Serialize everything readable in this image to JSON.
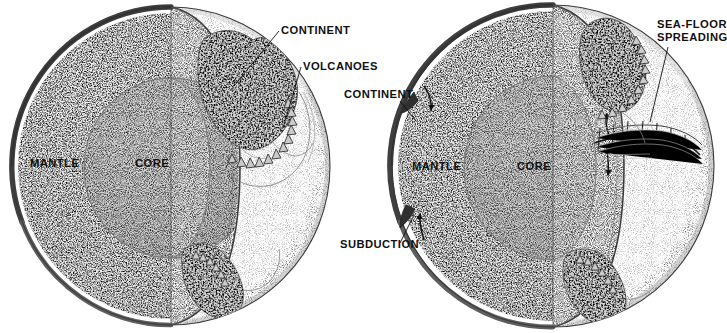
{
  "figure": {
    "background_color": "#ffffff",
    "style": "pen-and-ink stipple scientific illustration",
    "panels": [
      {
        "id": "left-globe",
        "name": "Earth cutaway without plate motion",
        "center": [
          171,
          166
        ],
        "radius": 159,
        "labels": [
          "CONTINENT",
          "VOLCANOES",
          "MANTLE",
          "CORE"
        ]
      },
      {
        "id": "right-globe",
        "name": "Earth cutaway with plate tectonics",
        "center": [
          553,
          166
        ],
        "radius": 161,
        "labels": [
          "SEA-FLOOR SPREADING",
          "CONTINENT",
          "SUBDUCTION",
          "MANTLE",
          "CORE"
        ]
      }
    ]
  },
  "colors": {
    "ink": "#111111",
    "crust": "#4a4a4a",
    "mantle_fill": "#ececec",
    "core_fill": "#d2d2d2",
    "sphere_fill": "#f7f7f7",
    "continent_fill": "#d8d8d8",
    "background": "#ffffff"
  },
  "left_globe": {
    "labels": {
      "continent": "CONTINENT",
      "volcanoes": "VOLCANOES",
      "mantle": "MANTLE",
      "core": "CORE"
    },
    "label_positions": {
      "continent": [
        281,
        34
      ],
      "volcanoes": [
        303,
        70
      ],
      "mantle": [
        30,
        167
      ],
      "core": [
        135,
        167
      ]
    }
  },
  "right_globe": {
    "labels": {
      "sea_floor_spreading_line1": "SEA-FLOOR",
      "sea_floor_spreading_line2": "SPREADING",
      "continent": "CONTINENT",
      "subduction": "SUBDUCTION",
      "mantle": "MANTLE",
      "core": "CORE"
    },
    "label_positions": {
      "sea_floor_spreading": [
        657,
        28
      ],
      "continent": [
        344,
        98
      ],
      "subduction": [
        340,
        248
      ],
      "mantle": [
        412,
        170
      ],
      "core": [
        517,
        170
      ]
    },
    "annotations": {
      "convection_arrows": 4,
      "ridge_transform_faults": 7
    }
  }
}
